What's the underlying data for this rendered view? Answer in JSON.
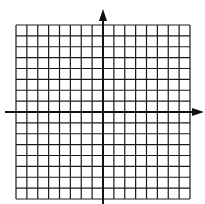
{
  "diagram": {
    "type": "coordinate-plane",
    "grid": {
      "columns": 16,
      "rows": 16,
      "left": 16,
      "top": 25,
      "right": 190,
      "bottom": 199,
      "line_color": "#1a1a1a",
      "background": "#ffffff"
    },
    "axes": {
      "x_axis_y": 112,
      "x_axis_start": 5,
      "x_axis_end": 204,
      "y_axis_x": 103,
      "y_axis_start": 204,
      "y_axis_end": 9,
      "color": "#111111",
      "x_arrow": "right",
      "y_arrow": "up"
    }
  }
}
